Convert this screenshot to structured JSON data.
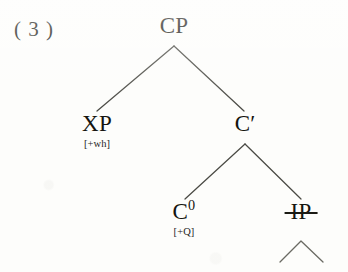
{
  "figure": {
    "example_number": "( 3 )",
    "background_color": "#fdfdfb",
    "ink_color": "#15150f"
  },
  "tree": {
    "type": "syntax-tree",
    "nodes": [
      {
        "id": "cp",
        "label": "CP",
        "feature": "",
        "struck": false,
        "x": 174,
        "y": 26
      },
      {
        "id": "xp",
        "label": "XP",
        "feature": "[+wh]",
        "struck": false,
        "x": 97,
        "y": 124
      },
      {
        "id": "cbar",
        "label": "C",
        "prime": "′",
        "feature": "",
        "struck": false,
        "x": 245,
        "y": 124
      },
      {
        "id": "c0",
        "label": "C",
        "superscript": "0",
        "feature": "[+Q]",
        "struck": false,
        "x": 184,
        "y": 212
      },
      {
        "id": "ip",
        "label": "IP",
        "feature": "",
        "struck": true,
        "x": 301,
        "y": 212
      }
    ],
    "edges": [
      {
        "from": "cp",
        "to": "xp"
      },
      {
        "from": "cp",
        "to": "cbar"
      },
      {
        "from": "cbar",
        "to": "c0"
      },
      {
        "from": "cbar",
        "to": "ip"
      }
    ],
    "triangle": {
      "under": "ip",
      "apex_x": 301,
      "apex_y": 240,
      "half_width": 22,
      "height": 20
    },
    "labels": {
      "cp": "CP",
      "xp": "XP",
      "xp_feature": "[+wh]",
      "cbar": "C′",
      "c0_base": "C",
      "c0_superscript": "0",
      "c0_feature": "[+Q]",
      "ip": "IP"
    }
  }
}
